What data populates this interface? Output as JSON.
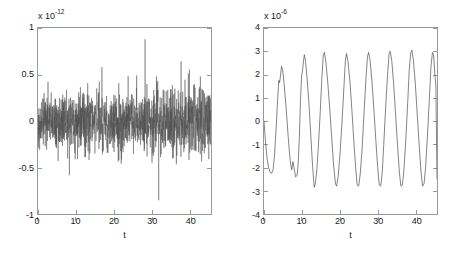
{
  "figure": {
    "background_color": "#ffffff",
    "axis_color": "#9a9a9a",
    "text_color": "#1a1a1a",
    "line_color": "#4d4d4d",
    "width": 452,
    "height": 258,
    "panel_count": 2
  },
  "chart_data": [
    {
      "type": "line",
      "panel": "left",
      "title": "",
      "subtitle": "",
      "xlabel": "t",
      "ylabel": "",
      "y_exponent_prefix": "x 10",
      "y_exponent": "-12",
      "y_exponent_label": "x 10-12",
      "xlim": [
        0,
        45.5
      ],
      "ylim": [
        -1,
        1
      ],
      "xticks": [
        0,
        10,
        20,
        30,
        40
      ],
      "xticklabels": [
        "0",
        "10",
        "20",
        "30",
        "40"
      ],
      "yticks": [
        -1,
        -0.5,
        0,
        0.5,
        1
      ],
      "yticklabels": [
        "-1",
        "-0.5",
        "0",
        "0.5",
        "1"
      ],
      "grid": false,
      "legend": null,
      "description": "Dense zero-mean broadband noise signal, typical RMS band +/-0.2, occasional spikes up to +0.8 and down to -0.9",
      "series": [
        {
          "name": "noise",
          "color": "#4d4d4d",
          "rms_band": 0.17,
          "max_peak": 0.82,
          "min_peak": -0.9,
          "samples": 1400
        }
      ]
    },
    {
      "type": "line",
      "panel": "right",
      "title": "",
      "subtitle": "",
      "xlabel": "t",
      "ylabel": "",
      "y_exponent_prefix": "x 10",
      "y_exponent": "-6",
      "y_exponent_label": "x 10-6",
      "xlim": [
        0,
        45.5
      ],
      "ylim": [
        -4,
        4
      ],
      "xticks": [
        0,
        10,
        20,
        30,
        40
      ],
      "xticklabels": [
        "0",
        "10",
        "20",
        "30",
        "40"
      ],
      "yticks": [
        -4,
        -3,
        -2,
        -1,
        0,
        1,
        2,
        3,
        4
      ],
      "yticklabels": [
        "-4",
        "-3",
        "-2",
        "-1",
        "0",
        "1",
        "2",
        "3",
        "4"
      ],
      "grid": false,
      "legend": null,
      "description": "Quasi-periodic oscillation, period about 5.3 units, growing from amplitude ~2.3 to steady ~3.0, with small notch distortions on early cycles",
      "series": [
        {
          "name": "oscillation",
          "color": "#4d4d4d",
          "period": 5.3,
          "amplitude_initial": 2.3,
          "amplitude_steady": 3.0,
          "points": [
            [
              0.0,
              0.0
            ],
            [
              0.4,
              -0.9
            ],
            [
              0.8,
              -1.6
            ],
            [
              1.2,
              -2.0
            ],
            [
              1.6,
              -2.2
            ],
            [
              2.0,
              -2.25
            ],
            [
              2.4,
              -2.1
            ],
            [
              2.8,
              -1.4
            ],
            [
              3.2,
              -0.3
            ],
            [
              3.6,
              1.0
            ],
            [
              3.9,
              1.75
            ],
            [
              4.1,
              1.65
            ],
            [
              4.3,
              1.9
            ],
            [
              4.6,
              2.35
            ],
            [
              4.9,
              2.2
            ],
            [
              5.3,
              1.6
            ],
            [
              5.8,
              0.6
            ],
            [
              6.2,
              -0.3
            ],
            [
              6.6,
              -1.2
            ],
            [
              7.0,
              -1.85
            ],
            [
              7.3,
              -2.1
            ],
            [
              7.6,
              -1.75
            ],
            [
              7.9,
              -2.0
            ],
            [
              8.3,
              -2.4
            ],
            [
              8.7,
              -2.35
            ],
            [
              9.0,
              -1.8
            ],
            [
              9.3,
              -0.7
            ],
            [
              9.6,
              0.9
            ],
            [
              9.9,
              2.0
            ],
            [
              10.1,
              2.1
            ],
            [
              10.3,
              2.45
            ],
            [
              10.6,
              2.85
            ],
            [
              10.9,
              2.6
            ],
            [
              11.3,
              1.9
            ],
            [
              11.8,
              0.8
            ],
            [
              12.3,
              -0.6
            ],
            [
              12.8,
              -2.0
            ],
            [
              13.2,
              -2.85
            ],
            [
              13.5,
              -2.7
            ],
            [
              13.9,
              -2.1
            ],
            [
              14.3,
              -1.1
            ],
            [
              14.8,
              0.4
            ],
            [
              15.2,
              1.8
            ],
            [
              15.6,
              2.85
            ],
            [
              15.9,
              2.95
            ],
            [
              16.3,
              2.5
            ],
            [
              16.8,
              1.6
            ],
            [
              17.3,
              0.5
            ],
            [
              17.8,
              -0.7
            ],
            [
              18.3,
              -1.9
            ],
            [
              18.8,
              -2.7
            ],
            [
              19.1,
              -2.8
            ],
            [
              19.5,
              -2.4
            ],
            [
              20.0,
              -1.4
            ],
            [
              20.5,
              -0.1
            ],
            [
              21.0,
              1.4
            ],
            [
              21.4,
              2.6
            ],
            [
              21.7,
              2.9
            ],
            [
              22.1,
              2.55
            ],
            [
              22.6,
              1.7
            ],
            [
              23.1,
              0.5
            ],
            [
              23.6,
              -0.8
            ],
            [
              24.1,
              -2.0
            ],
            [
              24.5,
              -2.75
            ],
            [
              24.9,
              -2.8
            ],
            [
              25.3,
              -2.3
            ],
            [
              25.8,
              -1.2
            ],
            [
              26.3,
              0.3
            ],
            [
              26.8,
              1.8
            ],
            [
              27.2,
              2.75
            ],
            [
              27.5,
              2.95
            ],
            [
              27.9,
              2.6
            ],
            [
              28.4,
              1.7
            ],
            [
              28.9,
              0.5
            ],
            [
              29.4,
              -0.8
            ],
            [
              29.9,
              -2.0
            ],
            [
              30.3,
              -2.75
            ],
            [
              30.7,
              -2.8
            ],
            [
              31.1,
              -2.2
            ],
            [
              31.5,
              -1.0
            ],
            [
              32.0,
              0.6
            ],
            [
              32.5,
              2.0
            ],
            [
              32.9,
              2.9
            ],
            [
              33.2,
              3.0
            ],
            [
              33.6,
              2.6
            ],
            [
              34.1,
              1.6
            ],
            [
              34.6,
              0.3
            ],
            [
              35.1,
              -1.0
            ],
            [
              35.6,
              -2.2
            ],
            [
              36.0,
              -2.8
            ],
            [
              36.4,
              -2.75
            ],
            [
              36.8,
              -2.1
            ],
            [
              37.3,
              -0.8
            ],
            [
              37.8,
              0.8
            ],
            [
              38.2,
              2.2
            ],
            [
              38.6,
              2.95
            ],
            [
              38.9,
              3.05
            ],
            [
              39.3,
              2.6
            ],
            [
              39.8,
              1.6
            ],
            [
              40.3,
              0.3
            ],
            [
              40.8,
              -1.0
            ],
            [
              41.3,
              -2.2
            ],
            [
              41.7,
              -2.8
            ],
            [
              42.1,
              -2.7
            ],
            [
              42.5,
              -2.0
            ],
            [
              43.0,
              -0.6
            ],
            [
              43.5,
              1.0
            ],
            [
              43.9,
              2.3
            ],
            [
              44.3,
              2.95
            ],
            [
              44.6,
              2.85
            ],
            [
              44.9,
              2.1
            ],
            [
              45.2,
              1.55
            ],
            [
              45.5,
              -2.5
            ]
          ]
        }
      ]
    }
  ]
}
